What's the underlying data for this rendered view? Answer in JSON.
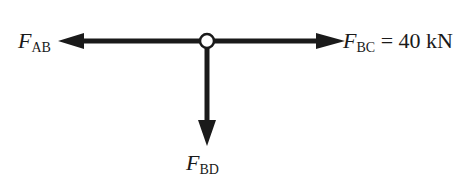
{
  "diagram": {
    "forces": [
      {
        "id": "AB",
        "symbol": "F",
        "subscript": "AB",
        "direction": "left",
        "value": ""
      },
      {
        "id": "BC",
        "symbol": "F",
        "subscript": "BC",
        "direction": "right",
        "value": "= 40 kN"
      },
      {
        "id": "BD",
        "symbol": "F",
        "subscript": "BD",
        "direction": "down",
        "value": ""
      }
    ],
    "node": {
      "label": "joint",
      "type": "pin"
    },
    "colors": {
      "line": "#1a1a1a",
      "background": "#ffffff"
    }
  }
}
